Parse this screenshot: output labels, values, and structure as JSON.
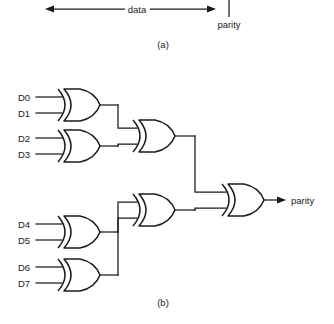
{
  "figure": {
    "panel_a": {
      "caption": "(a)",
      "data_label": "data",
      "parity_label": "parity",
      "arrow_left_x": 45,
      "arrow_right_x": 216,
      "arrow_y": 9,
      "tick_x": 229,
      "tick_top": 0,
      "tick_bottom": 17
    },
    "panel_b": {
      "caption": "(b)",
      "output_label": "parity",
      "inputs": [
        {
          "name": "D0",
          "x": 18,
          "y": 97
        },
        {
          "name": "D1",
          "x": 18,
          "y": 113
        },
        {
          "name": "D2",
          "x": 18,
          "y": 138
        },
        {
          "name": "D3",
          "x": 18,
          "y": 154
        },
        {
          "name": "D4",
          "x": 18,
          "y": 224
        },
        {
          "name": "D5",
          "x": 18,
          "y": 240
        },
        {
          "name": "D6",
          "x": 18,
          "y": 267
        },
        {
          "name": "D7",
          "x": 18,
          "y": 283
        }
      ],
      "gates": [
        {
          "id": "xor-d0-d1",
          "type": "xor",
          "x": 58,
          "y": 89,
          "w": 42,
          "h": 32
        },
        {
          "id": "xor-d2-d3",
          "type": "xor",
          "x": 58,
          "y": 130,
          "w": 42,
          "h": 32
        },
        {
          "id": "xor-d4-d5",
          "type": "xor",
          "x": 58,
          "y": 216,
          "w": 42,
          "h": 32
        },
        {
          "id": "xor-d6-d7",
          "type": "xor",
          "x": 58,
          "y": 259,
          "w": 42,
          "h": 32
        },
        {
          "id": "xor-upper-merge",
          "type": "xor",
          "x": 133,
          "y": 120,
          "w": 42,
          "h": 32
        },
        {
          "id": "xor-lower-merge",
          "type": "xor",
          "x": 133,
          "y": 194,
          "w": 42,
          "h": 32
        },
        {
          "id": "xor-final",
          "type": "xor",
          "x": 222,
          "y": 184,
          "w": 42,
          "h": 32
        }
      ]
    }
  }
}
